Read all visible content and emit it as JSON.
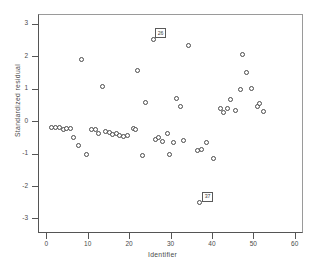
{
  "chart_data": {
    "type": "scatter",
    "title": "",
    "xlabel": "Identifier",
    "ylabel": "Standardized residual",
    "xlim": [
      -2,
      62
    ],
    "ylim": [
      -3.45,
      3.3
    ],
    "grid": false,
    "legend": null,
    "marker": "open-circle",
    "xticks": [
      0,
      10,
      20,
      30,
      40,
      50,
      60
    ],
    "yticks": [
      3,
      2,
      1,
      0,
      -1,
      -2,
      -3
    ],
    "xtick_labels": [
      "0",
      "10",
      "20",
      "30",
      "40",
      "50",
      "60"
    ],
    "ytick_labels": [
      "3",
      "2",
      "1",
      "0",
      "-1",
      "-2",
      "-3"
    ],
    "points": [
      {
        "x": 1.2,
        "y": -0.2
      },
      {
        "x": 2.3,
        "y": -0.2
      },
      {
        "x": 3.2,
        "y": -0.21
      },
      {
        "x": 4.1,
        "y": -0.25
      },
      {
        "x": 5.0,
        "y": -0.24
      },
      {
        "x": 5.9,
        "y": -0.24
      },
      {
        "x": 6.6,
        "y": -0.52
      },
      {
        "x": 7.7,
        "y": -0.76
      },
      {
        "x": 8.5,
        "y": 1.91
      },
      {
        "x": 9.6,
        "y": -1.02
      },
      {
        "x": 11.0,
        "y": -0.27
      },
      {
        "x": 11.9,
        "y": -0.27
      },
      {
        "x": 12.6,
        "y": -0.37
      },
      {
        "x": 13.6,
        "y": 1.08
      },
      {
        "x": 14.3,
        "y": -0.32
      },
      {
        "x": 15.2,
        "y": -0.34
      },
      {
        "x": 16.1,
        "y": -0.42
      },
      {
        "x": 16.9,
        "y": -0.39
      },
      {
        "x": 17.8,
        "y": -0.44
      },
      {
        "x": 18.7,
        "y": -0.47
      },
      {
        "x": 19.5,
        "y": -0.46
      },
      {
        "x": 21.0,
        "y": -0.22
      },
      {
        "x": 21.6,
        "y": -0.27
      },
      {
        "x": 22.0,
        "y": 1.56
      },
      {
        "x": 23.2,
        "y": -1.07
      },
      {
        "x": 24.0,
        "y": 0.57
      },
      {
        "x": 26.0,
        "y": 2.52
      },
      {
        "x": 26.4,
        "y": -0.57
      },
      {
        "x": 27.2,
        "y": -0.52
      },
      {
        "x": 28.1,
        "y": -0.64
      },
      {
        "x": 29.2,
        "y": -0.38
      },
      {
        "x": 29.8,
        "y": -1.04
      },
      {
        "x": 30.7,
        "y": -0.67
      },
      {
        "x": 31.5,
        "y": 0.69
      },
      {
        "x": 32.4,
        "y": 0.45
      },
      {
        "x": 33.1,
        "y": -0.59
      },
      {
        "x": 34.3,
        "y": 2.34
      },
      {
        "x": 36.5,
        "y": -0.9
      },
      {
        "x": 37.1,
        "y": -2.52
      },
      {
        "x": 37.4,
        "y": -0.89
      },
      {
        "x": 38.6,
        "y": -0.67
      },
      {
        "x": 40.4,
        "y": -1.14
      },
      {
        "x": 42.0,
        "y": 0.4
      },
      {
        "x": 42.9,
        "y": 0.26
      },
      {
        "x": 43.7,
        "y": 0.39
      },
      {
        "x": 44.6,
        "y": 0.66
      },
      {
        "x": 45.7,
        "y": 0.33
      },
      {
        "x": 46.8,
        "y": 0.97
      },
      {
        "x": 47.4,
        "y": 2.05
      },
      {
        "x": 48.3,
        "y": 1.49
      },
      {
        "x": 49.6,
        "y": 1.01
      },
      {
        "x": 50.9,
        "y": 0.46
      },
      {
        "x": 51.6,
        "y": 0.54
      },
      {
        "x": 52.5,
        "y": 0.28
      }
    ],
    "annotations": [
      {
        "label": "26",
        "x": 26.0,
        "y": 2.52,
        "position": "above-left"
      },
      {
        "label": "37",
        "x": 37.1,
        "y": -2.52,
        "position": "above-right"
      }
    ]
  }
}
